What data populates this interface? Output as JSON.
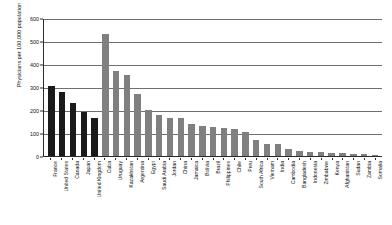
{
  "chart_data": {
    "type": "bar",
    "title": "",
    "xlabel": "",
    "ylabel": "Physicians per 100,000 population",
    "ylim": [
      0,
      600
    ],
    "yticks": [
      0,
      100,
      200,
      300,
      400,
      500,
      600
    ],
    "grid": true,
    "legend": "none",
    "categories": [
      "France",
      "United States",
      "Canada",
      "Japan",
      "United Kingdom",
      "Cuba",
      "Uruguay",
      "Kazakhstan",
      "Argentina",
      "Egypt",
      "Saudi Arabia",
      "Jordan",
      "China",
      "Jamaica",
      "Bolivia",
      "Brazil",
      "Philippines",
      "Chile",
      "Peru",
      "South Africa",
      "Vietnam",
      "India",
      "Cambodia",
      "Bangladesh",
      "Indonesia",
      "Zimbabwe",
      "Kenya",
      "Afghanistan",
      "Sudan",
      "Zambia",
      "Somalia"
    ],
    "values": [
      305,
      279,
      229,
      193,
      164,
      530,
      370,
      353,
      268,
      200,
      177,
      166,
      164,
      141,
      130,
      127,
      123,
      118,
      103,
      69,
      53,
      51,
      30,
      23,
      16,
      16,
      14,
      11,
      9,
      7,
      4
    ],
    "bar_colors": [
      "#1a1a1a",
      "#1a1a1a",
      "#1a1a1a",
      "#1a1a1a",
      "#1a1a1a",
      "#808080",
      "#808080",
      "#808080",
      "#808080",
      "#808080",
      "#808080",
      "#808080",
      "#808080",
      "#808080",
      "#808080",
      "#808080",
      "#808080",
      "#808080",
      "#808080",
      "#808080",
      "#808080",
      "#808080",
      "#808080",
      "#808080",
      "#808080",
      "#808080",
      "#808080",
      "#808080",
      "#808080",
      "#808080",
      "#808080"
    ],
    "colors": {
      "highlight": "#1a1a1a",
      "standard": "#808080",
      "axis": "#2b2b2b",
      "grid": "#6f6f6f",
      "background": "#ffffff"
    }
  }
}
